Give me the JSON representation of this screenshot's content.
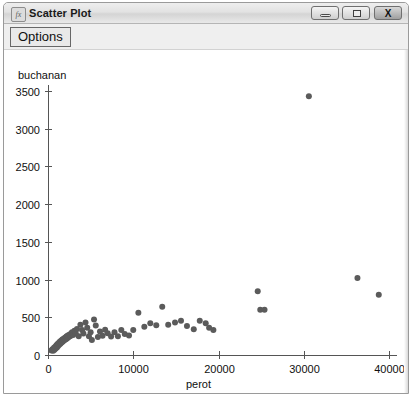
{
  "window": {
    "title": "Scatter Plot",
    "icon": "chart-app-icon",
    "buttons": {
      "minimize": {
        "name": "minimize-icon",
        "label": "–"
      },
      "maximize": {
        "name": "maximize-icon",
        "label": "□"
      },
      "close": {
        "name": "close-icon",
        "label": "X"
      }
    }
  },
  "toolbar": {
    "options_label": "Options"
  },
  "chart_data": {
    "type": "scatter",
    "title": "",
    "xlabel": "perot",
    "ylabel": "buchanan",
    "xlim": [
      0,
      41000
    ],
    "ylim": [
      0,
      3600
    ],
    "xticks": [
      0,
      10000,
      20000,
      30000,
      40000
    ],
    "xtick_labels": [
      "0",
      "10000",
      "20000",
      "30000",
      "40000"
    ],
    "yticks": [
      0,
      500,
      1000,
      1500,
      2000,
      2500,
      3000,
      3500
    ],
    "ytick_labels": [
      "0",
      "500",
      "1000",
      "1500",
      "2000",
      "2500",
      "3000",
      "3500"
    ],
    "grid": false,
    "legend": false,
    "marker": "circle",
    "marker_color": "#5b5b5b",
    "marker_size": 3,
    "points": [
      [
        400,
        60
      ],
      [
        520,
        75
      ],
      [
        610,
        55
      ],
      [
        700,
        95
      ],
      [
        760,
        70
      ],
      [
        840,
        110
      ],
      [
        900,
        85
      ],
      [
        980,
        130
      ],
      [
        1050,
        100
      ],
      [
        1120,
        145
      ],
      [
        1180,
        120
      ],
      [
        1250,
        160
      ],
      [
        1310,
        135
      ],
      [
        1380,
        175
      ],
      [
        1450,
        150
      ],
      [
        1520,
        190
      ],
      [
        1600,
        165
      ],
      [
        1680,
        205
      ],
      [
        1750,
        180
      ],
      [
        1830,
        215
      ],
      [
        1900,
        195
      ],
      [
        1980,
        230
      ],
      [
        2060,
        205
      ],
      [
        2150,
        245
      ],
      [
        2230,
        220
      ],
      [
        2320,
        260
      ],
      [
        2400,
        235
      ],
      [
        2500,
        270
      ],
      [
        2600,
        250
      ],
      [
        2700,
        285
      ],
      [
        2820,
        300
      ],
      [
        2950,
        265
      ],
      [
        3100,
        320
      ],
      [
        3250,
        290
      ],
      [
        3400,
        345
      ],
      [
        3600,
        250
      ],
      [
        3800,
        400
      ],
      [
        4000,
        330
      ],
      [
        4150,
        285
      ],
      [
        4400,
        430
      ],
      [
        4600,
        360
      ],
      [
        4800,
        250
      ],
      [
        5000,
        300
      ],
      [
        5150,
        200
      ],
      [
        5400,
        470
      ],
      [
        5600,
        390
      ],
      [
        5850,
        240
      ],
      [
        6100,
        310
      ],
      [
        6400,
        255
      ],
      [
        6700,
        335
      ],
      [
        7000,
        290
      ],
      [
        7400,
        245
      ],
      [
        7800,
        300
      ],
      [
        8200,
        250
      ],
      [
        8600,
        330
      ],
      [
        9000,
        280
      ],
      [
        9500,
        260
      ],
      [
        10000,
        330
      ],
      [
        10600,
        560
      ],
      [
        11300,
        375
      ],
      [
        12000,
        420
      ],
      [
        12700,
        395
      ],
      [
        13400,
        640
      ],
      [
        14100,
        400
      ],
      [
        14900,
        430
      ],
      [
        15600,
        455
      ],
      [
        16300,
        385
      ],
      [
        17100,
        340
      ],
      [
        17800,
        455
      ],
      [
        18500,
        420
      ],
      [
        18900,
        360
      ],
      [
        19400,
        330
      ],
      [
        24600,
        845
      ],
      [
        24900,
        600
      ],
      [
        25400,
        600
      ],
      [
        30600,
        3430
      ],
      [
        36300,
        1020
      ],
      [
        38800,
        800
      ]
    ]
  }
}
